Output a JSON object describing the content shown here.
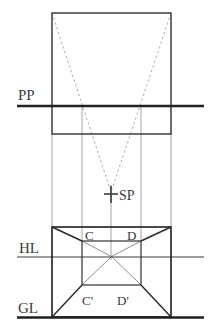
{
  "diagram": {
    "labels": {
      "picture_plane": "PP",
      "horizon_line": "HL",
      "ground_line": "GL",
      "station_point": "SP",
      "point_c": "C",
      "point_d": "D",
      "point_c_prime": "C'",
      "point_d_prime": "D'"
    },
    "colors": {
      "background": "#ffffff",
      "primary_line": "#2b2b2b",
      "picture_plane_line": "#222222",
      "ground_line": "#1f1f1f",
      "construction_line": "#9a9a9a",
      "dashed_sightline": "#a6a6a6",
      "label_text": "#3a3a3a"
    }
  }
}
